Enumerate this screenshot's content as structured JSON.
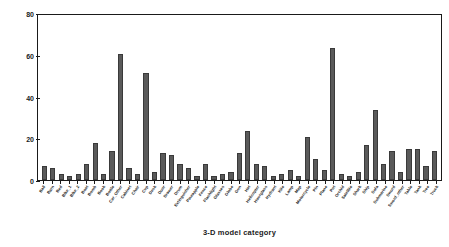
{
  "chart_data": {
    "type": "bar",
    "title": "",
    "xlabel": "3-D model category",
    "ylabel": "# Models",
    "ylim": [
      0,
      80
    ],
    "yticks": [
      0,
      20,
      40,
      60,
      80
    ],
    "grid": false,
    "legend": null,
    "bar_color": "#5a5a5a",
    "bar_edge_color": "#3a3a3a",
    "axis_color": "#1a1a1a",
    "background": "#ffffff",
    "categories": [
      "Ball",
      "Barn",
      "Bed",
      "Bike_1",
      "Bike_2",
      "Boat",
      "Bomb",
      "Book",
      "Bottle",
      "Car_Other",
      "Cabinet",
      "Chair",
      "Cup",
      "Desk",
      "Door",
      "Drawer",
      "Drum",
      "Extinguisher",
      "Pineapple",
      "Fence",
      "Flashlight",
      "Glasses",
      "Globe",
      "Gun",
      "Hat",
      "Helicopter",
      "Hourglass",
      "Hydrant",
      "Kite",
      "Lamp",
      "Map",
      "Motorcycle",
      "Pin",
      "Plane",
      "Pot",
      "Orchid",
      "Satellite",
      "Shark",
      "Ship",
      "Sofa",
      "Submarine",
      "Sword",
      "Sword_other",
      "Table",
      "Tank",
      "Tree",
      "Truck"
    ],
    "values": [
      7,
      6,
      3,
      2,
      3,
      8,
      18,
      3,
      14,
      61,
      6,
      3,
      52,
      4,
      13,
      12,
      8,
      6,
      2,
      8,
      2,
      3,
      4,
      13,
      24,
      8,
      7,
      2,
      3,
      5,
      2,
      21,
      10,
      5,
      64,
      3,
      2,
      4,
      17,
      34,
      8,
      14,
      4,
      15,
      15,
      7,
      14
    ],
    "n_categories": 47
  },
  "axes": {
    "y_title": "# Models",
    "x_title": "3-D model category"
  }
}
